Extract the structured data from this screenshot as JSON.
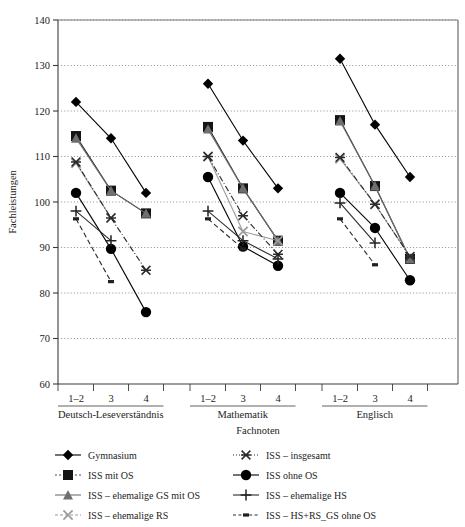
{
  "chart_data": {
    "type": "line",
    "title": "",
    "xlabel": "Fachnoten",
    "ylabel": "Fachleistungen",
    "ylim": [
      60,
      140
    ],
    "yticks": [
      60,
      70,
      80,
      90,
      100,
      110,
      120,
      130,
      140
    ],
    "grid": true,
    "legend_position": "bottom",
    "groups": [
      {
        "name": "Deutsch-Leseverständnis",
        "categories": [
          "1–2",
          "3",
          "4"
        ]
      },
      {
        "name": "Mathematik",
        "categories": [
          "1–2",
          "3",
          "4"
        ]
      },
      {
        "name": "Englisch",
        "categories": [
          "1–2",
          "3",
          "4"
        ]
      }
    ],
    "categories": [
      "1–2",
      "3",
      "4"
    ],
    "series": [
      {
        "name": "Gymnasium",
        "marker": "diamond",
        "line": "solid",
        "color": "#000000",
        "values": {
          "Deutsch-Leseverständnis": [
            122,
            114,
            102
          ],
          "Mathematik": [
            126,
            113.5,
            103
          ],
          "Englisch": [
            131.5,
            117,
            105.5
          ]
        }
      },
      {
        "name": "ISS mit OS",
        "marker": "square",
        "line": "solid",
        "color": "#1a1a1a",
        "values": {
          "Deutsch-Leseverständnis": [
            114.5,
            102.5,
            97.5
          ],
          "Mathematik": [
            116.5,
            103,
            91.5
          ],
          "Englisch": [
            118,
            103.5,
            87.5
          ]
        }
      },
      {
        "name": "ISS – ehemalige GS mit OS",
        "marker": "triangle",
        "line": "solid",
        "color": "#6f6f6f",
        "values": {
          "Deutsch-Leseverständnis": [
            114,
            102.5,
            97.5
          ],
          "Mathematik": [
            116,
            103,
            91.5
          ],
          "Englisch": [
            117.8,
            103.5,
            87.5
          ]
        }
      },
      {
        "name": "ISS – ehemalige RS",
        "marker": "cross-x",
        "line": "solid-light",
        "color": "#9b9b9b",
        "values": {
          "Deutsch-Leseverständnis": [
            108.5,
            96.5,
            null
          ],
          "Mathematik": [
            110,
            93.5,
            91.5
          ],
          "Englisch": [
            109.5,
            99.5,
            88
          ]
        }
      },
      {
        "name": "ISS – insgesamt",
        "marker": "asterisk",
        "line": "dash-dot",
        "color": "#2b2b2b",
        "values": {
          "Deutsch-Leseverständnis": [
            108.8,
            96.5,
            85
          ],
          "Mathematik": [
            110,
            97,
            88.5
          ],
          "Englisch": [
            109.8,
            99.5,
            88
          ]
        }
      },
      {
        "name": "ISS ohne OS",
        "marker": "circle",
        "line": "solid",
        "color": "#000000",
        "values": {
          "Deutsch-Leseverständnis": [
            102,
            89.7,
            75.8
          ],
          "Mathematik": [
            105.5,
            90.2,
            86
          ],
          "Englisch": [
            102,
            94.3,
            82.8
          ]
        }
      },
      {
        "name": "ISS – ehemalige HS",
        "marker": "plus",
        "line": "solid",
        "color": "#2b2b2b",
        "values": {
          "Deutsch-Leseverständnis": [
            98,
            91.5,
            null
          ],
          "Mathematik": [
            98,
            91.5,
            87.5
          ],
          "Englisch": [
            99.8,
            91,
            null
          ]
        }
      },
      {
        "name": "ISS – HS+RS_GS ohne OS",
        "marker": "small-square",
        "line": "dashed",
        "color": "#2b2b2b",
        "values": {
          "Deutsch-Leseverständnis": [
            96.3,
            82.5,
            null
          ],
          "Mathematik": [
            96.3,
            89.7,
            null
          ],
          "Englisch": [
            96.3,
            86.2,
            null
          ]
        }
      }
    ]
  },
  "legend": {
    "column_left": [
      {
        "label": "Gymnasium",
        "marker": "diamond"
      },
      {
        "label": "ISS mit OS",
        "marker": "square"
      },
      {
        "label": "ISS – ehemalige GS mit OS",
        "marker": "triangle"
      },
      {
        "label": "ISS – ehemalige RS",
        "marker": "cross-x"
      }
    ],
    "column_right": [
      {
        "label": "ISS – insgesamt",
        "marker": "asterisk"
      },
      {
        "label": "ISS ohne OS",
        "marker": "circle"
      },
      {
        "label": "ISS – ehemalige HS",
        "marker": "plus"
      },
      {
        "label": "ISS – HS+RS_GS ohne OS",
        "marker": "small-square"
      }
    ]
  }
}
